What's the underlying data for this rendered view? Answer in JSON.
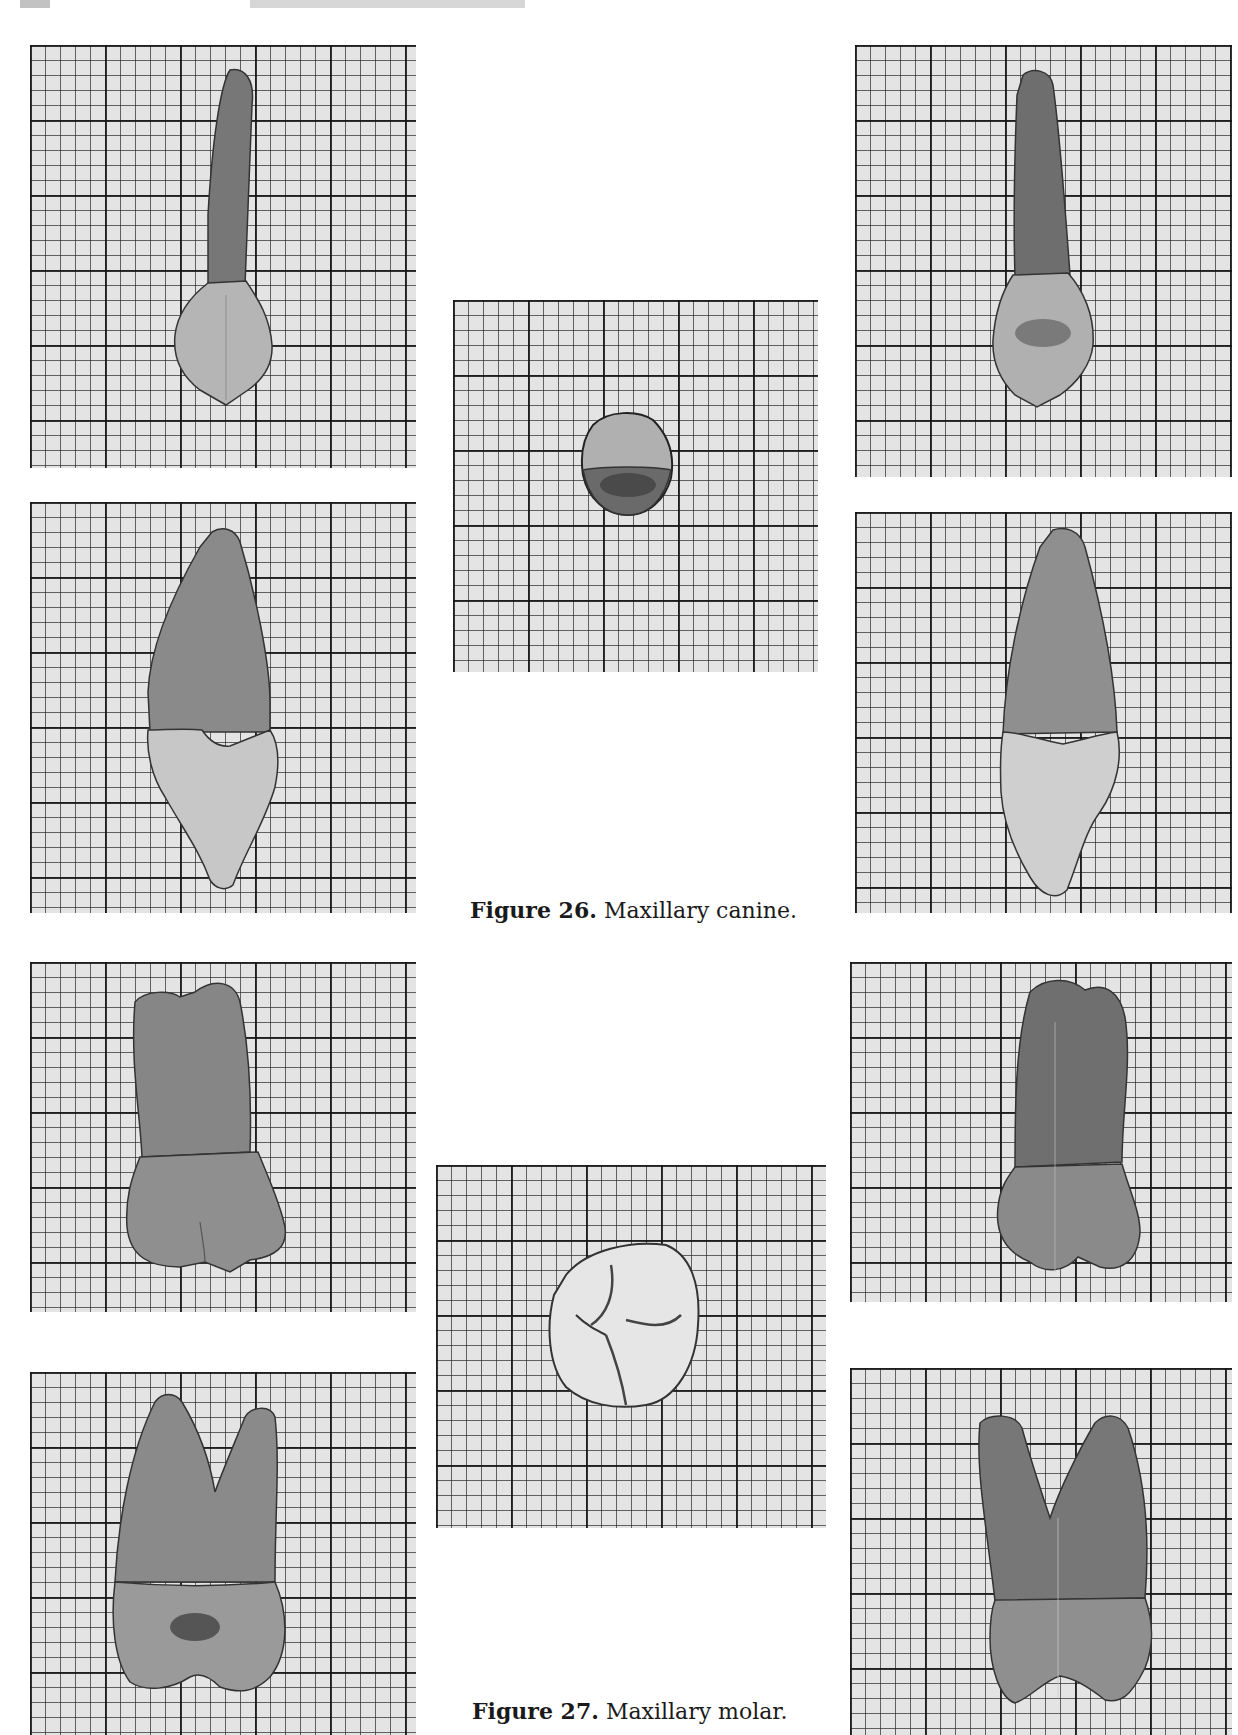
{
  "page": {
    "header_fragment": "",
    "background": "#ffffff",
    "grid_paper": {
      "minor_px": 15,
      "major_px": 75,
      "paper_color": "#e4e4e4",
      "line_color": "#222222"
    }
  },
  "figures": [
    {
      "number_label": "Figure 26.",
      "title": "Maxillary canine.",
      "views": [
        {
          "id": "canine-labial",
          "position": "left-top",
          "crown_color": "#b5b5b5",
          "root_color": "#777777"
        },
        {
          "id": "canine-mesial",
          "position": "left-bottom",
          "crown_color": "#c7c7c7",
          "root_color": "#8a8a8a"
        },
        {
          "id": "canine-incisal",
          "position": "center",
          "crown_color": "#b0b0b0",
          "root_color": "#6a6a6a"
        },
        {
          "id": "canine-lingual",
          "position": "right-top",
          "crown_color": "#b0b0b0",
          "root_color": "#6e6e6e"
        },
        {
          "id": "canine-distal",
          "position": "right-bottom",
          "crown_color": "#cfcfcf",
          "root_color": "#8f8f8f"
        }
      ]
    },
    {
      "number_label": "Figure 27.",
      "title": "Maxillary molar.",
      "views": [
        {
          "id": "molar-buccal",
          "position": "left-top",
          "crown_color": "#8f8f8f",
          "root_color": "#868686"
        },
        {
          "id": "molar-mesial",
          "position": "left-bottom",
          "crown_color": "#9a9a9a",
          "root_color": "#8a8a8a"
        },
        {
          "id": "molar-occlusal",
          "position": "center",
          "crown_color": "#e6e6e6",
          "root_color": "#444444"
        },
        {
          "id": "molar-lingual",
          "position": "right-top",
          "crown_color": "#8a8a8a",
          "root_color": "#6f6f6f"
        },
        {
          "id": "molar-distal",
          "position": "right-bottom",
          "crown_color": "#8f8f8f",
          "root_color": "#777777"
        }
      ]
    }
  ]
}
